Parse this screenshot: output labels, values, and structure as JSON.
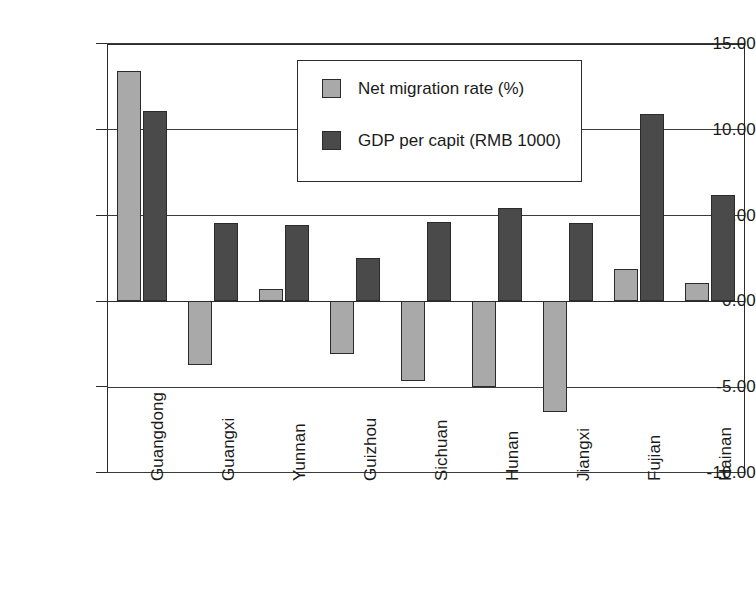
{
  "chart_data": {
    "type": "bar",
    "title": "",
    "subtitle": "",
    "xlabel": "",
    "ylabel": "",
    "ylim": [
      -10.0,
      15.0
    ],
    "yticks": [
      "-10.00",
      "-5.00",
      "0.00",
      "5.00",
      "10.00",
      "15.00"
    ],
    "ytick_values": [
      -10.0,
      -5.0,
      0.0,
      5.0,
      10.0,
      15.0
    ],
    "grid": "horizontal",
    "legend_position": "top-center",
    "categories": [
      "Guangdong",
      "Guangxi",
      "Yunnan",
      "Guizhou",
      "Sichuan",
      "Hunan",
      "Jiangxi",
      "Fujian",
      "Hainan"
    ],
    "series": [
      {
        "name": "Net migration rate (%)",
        "color": "#a9a9a9",
        "values": [
          13.4,
          -3.7,
          0.75,
          -3.05,
          -4.65,
          -5.0,
          -6.45,
          1.9,
          1.1
        ]
      },
      {
        "name": "GDP per capit (RMB 1000)",
        "color": "#4a4a4a",
        "values": [
          11.1,
          4.55,
          4.45,
          2.55,
          4.6,
          5.45,
          4.55,
          10.9,
          6.2
        ]
      }
    ]
  },
  "legend": {
    "entries": [
      {
        "label": "Net migration rate (%)"
      },
      {
        "label": "GDP per capit (RMB 1000)"
      }
    ]
  },
  "colors": {
    "series_light": "#a9a9a9",
    "series_dark": "#4a4a4a",
    "axis": "#2b2b2b",
    "background": "#ffffff"
  }
}
